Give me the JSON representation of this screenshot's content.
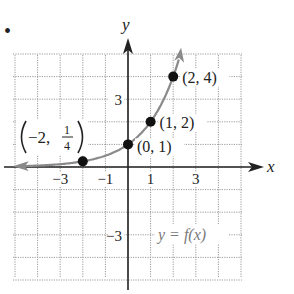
{
  "bullet": "•",
  "chart_data": {
    "type": "line",
    "title": "",
    "function_label": "y = f(x)",
    "xlabel": "x",
    "ylabel": "y",
    "xlim": [
      -5,
      5
    ],
    "ylim": [
      -5,
      5
    ],
    "grid": true,
    "x_ticks": [
      {
        "value": -3,
        "label": "−3"
      },
      {
        "value": -1,
        "label": "−1"
      },
      {
        "value": 1,
        "label": "1"
      },
      {
        "value": 3,
        "label": "3"
      }
    ],
    "y_ticks": [
      {
        "value": 3,
        "label": "3"
      },
      {
        "value": -3,
        "label": "−3"
      }
    ],
    "series": [
      {
        "name": "y = f(x) = 2^x",
        "x": [
          -5,
          -2,
          0,
          1,
          2,
          2.3
        ],
        "y": [
          0.03125,
          0.25,
          1,
          2,
          4,
          4.92
        ]
      }
    ],
    "points": [
      {
        "x": -2,
        "y": 0.25,
        "label_main": "−2, ",
        "label_num": "1",
        "label_den": "4"
      },
      {
        "x": 0,
        "y": 1,
        "label": "(0, 1)"
      },
      {
        "x": 1,
        "y": 2,
        "label": "(1, 2)"
      },
      {
        "x": 2,
        "y": 4,
        "label": "(2, 4)"
      }
    ],
    "colors": {
      "curve": "#8a8a8a",
      "axis": "#222222",
      "grid": "#9a9a9a",
      "point": "#111111"
    }
  }
}
